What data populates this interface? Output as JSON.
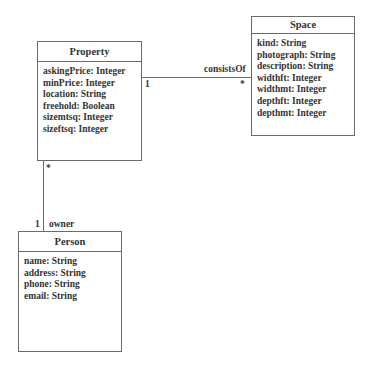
{
  "diagram": {
    "type": "uml-class-diagram",
    "classes": [
      {
        "name": "Property",
        "attributes": [
          "askingPrice: Integer",
          "minPrice: Integer",
          "location: String",
          "freehold: Boolean",
          "sizemtsq: Integer",
          "sizeftsq: Integer"
        ]
      },
      {
        "name": "Space",
        "attributes": [
          "kind: String",
          "photograph: String",
          "description: String",
          "widthft: Integer",
          "widthmt: Integer",
          "depthft: Integer",
          "depthmt: Integer"
        ]
      },
      {
        "name": "Person",
        "attributes": [
          "name: String",
          "address: String",
          "phone: String",
          "email: String"
        ]
      }
    ],
    "associations": [
      {
        "from": "Property",
        "to": "Space",
        "name": "consistsOf",
        "from_multiplicity": "1",
        "to_multiplicity": "*"
      },
      {
        "from": "Property",
        "to": "Person",
        "role": "owner",
        "from_multiplicity": "*",
        "to_multiplicity": "1"
      }
    ]
  }
}
